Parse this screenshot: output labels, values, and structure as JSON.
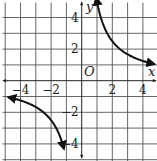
{
  "chart_data": {
    "type": "line",
    "title": "",
    "function": "y = 5/x",
    "xlabel": "x",
    "ylabel": "y",
    "origin_label": "O",
    "xlim": [
      -5,
      5
    ],
    "ylim": [
      -5,
      5
    ],
    "grid": true,
    "x_ticks": [
      {
        "value": -4,
        "label": "−4"
      },
      {
        "value": -2,
        "label": "−2"
      },
      {
        "value": 2,
        "label": "2"
      },
      {
        "value": 4,
        "label": "4"
      }
    ],
    "y_ticks": [
      {
        "value": 4,
        "label": "4"
      },
      {
        "value": 2,
        "label": "2"
      },
      {
        "value": -2,
        "label": "−2"
      },
      {
        "value": -4,
        "label": "−4"
      }
    ],
    "series": [
      {
        "name": "branch-right",
        "x": [
          0.95,
          1.25,
          1.67,
          2,
          2.5,
          3,
          3.5,
          4,
          4.75
        ],
        "y": [
          5.26,
          4,
          3,
          2.5,
          2,
          1.67,
          1.43,
          1.25,
          1.05
        ]
      },
      {
        "name": "branch-left",
        "x": [
          -4.8,
          -4,
          -3.5,
          -3,
          -2.5,
          -2,
          -1.67,
          -1.4,
          -1.16
        ],
        "y": [
          -1.04,
          -1.25,
          -1.43,
          -1.67,
          -2,
          -2.5,
          -3,
          -3.57,
          -4.3
        ]
      }
    ],
    "colors": {
      "curve": "#111111",
      "grid": "#555555",
      "background": "#ffffff"
    }
  }
}
